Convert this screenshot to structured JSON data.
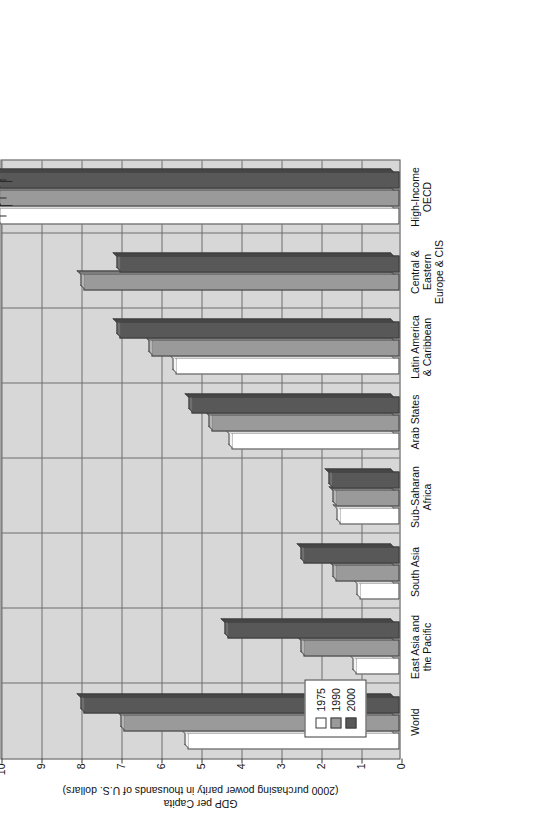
{
  "chart_data": {
    "type": "bar",
    "orientation": "vertical-rendered-rotated",
    "title": "",
    "xlabel": "",
    "ylabel": "GDP per Capita",
    "ylabel_sub": "(2000 purchasing power parity in thousands of U.S. dollars)",
    "ylim": [
      0,
      10
    ],
    "ytick_labels": [
      "0",
      "1",
      "2",
      "3",
      "4",
      "5",
      "6",
      "7",
      "8",
      "9",
      "10"
    ],
    "ytick_values": [
      0,
      1,
      2,
      3,
      4,
      5,
      6,
      7,
      8,
      9,
      10
    ],
    "grid": true,
    "legend_position": "inside-lower-left",
    "categories": [
      "World",
      "East Asia and\nthe Pacific",
      "South Asia",
      "Sub-Saharan\nAfrica",
      "Arab States",
      "Latin America\n& Caribbean",
      "Central &\nEastern\nEurope & CIS",
      "High-Income\nOECD"
    ],
    "series": [
      {
        "name": "1975",
        "color": "#ffffff",
        "values": [
          5.3,
          1.1,
          1.0,
          1.5,
          4.2,
          5.6,
          null,
          10.0
        ]
      },
      {
        "name": "1990",
        "color": "#9a9a9a",
        "values": [
          6.9,
          2.4,
          1.6,
          1.6,
          4.7,
          6.2,
          7.9,
          10.0
        ]
      },
      {
        "name": "2000",
        "color": "#585858",
        "values": [
          7.9,
          4.3,
          2.4,
          1.7,
          5.2,
          7.0,
          7.0,
          10.0
        ]
      }
    ],
    "axis_break": {
      "present": true,
      "note": "High-Income OECD bars exceed the 10 axis maximum and are drawn past a break mark"
    },
    "annotations": [
      {
        "text": "$16,048",
        "series": "1975",
        "category": "High-Income OECD"
      },
      {
        "text": "$23,267",
        "series": "1990",
        "category": "High-Income OECD"
      },
      {
        "text": "$27,843",
        "series": "2000",
        "category": "High-Income OECD"
      }
    ]
  },
  "legend": {
    "items": [
      {
        "label": "1975"
      },
      {
        "label": "1990"
      },
      {
        "label": "2000"
      }
    ]
  }
}
